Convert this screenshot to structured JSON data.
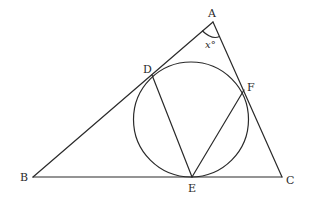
{
  "diagram": {
    "points": {
      "A": {
        "label": "A",
        "x": 213,
        "y": 22
      },
      "B": {
        "label": "B",
        "x": 33,
        "y": 177
      },
      "C": {
        "label": "C",
        "x": 282,
        "y": 177
      },
      "D": {
        "label": "D",
        "x": 152,
        "y": 75
      },
      "E": {
        "label": "E",
        "x": 192,
        "y": 177
      },
      "F": {
        "label": "F",
        "x": 244,
        "y": 90
      }
    },
    "circle": {
      "cx": 191,
      "cy": 119.5,
      "r": 57.5
    },
    "segments": [
      [
        "A",
        "B"
      ],
      [
        "A",
        "C"
      ],
      [
        "B",
        "C"
      ],
      [
        "D",
        "E"
      ],
      [
        "E",
        "F"
      ]
    ],
    "angle_mark": {
      "vertex": "A",
      "label": "x°"
    },
    "stroke_color": "#2a2a2a",
    "background_color": "#ffffff"
  }
}
